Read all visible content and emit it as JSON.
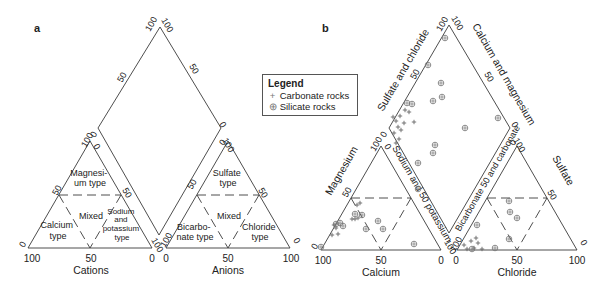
{
  "panels": {
    "a": {
      "label": "a",
      "cation_axis_title": "Cations",
      "anion_axis_title": "Anions",
      "cation_ticks": [
        "100",
        "50",
        "0"
      ],
      "anion_ticks": [
        "0",
        "50",
        "100"
      ],
      "regions": {
        "magnesium": [
          "Magnesi-",
          "um type"
        ],
        "mixed_cation": [
          "Mixed"
        ],
        "calcium": [
          "Calcium",
          "type"
        ],
        "sodium_potassium": [
          "Sodium",
          "and",
          "potassium",
          "type"
        ],
        "sulfate": [
          "Sulfate",
          "type"
        ],
        "mixed_anion": [
          "Mixed"
        ],
        "bicarbonate": [
          "Bicarbo-",
          "nate type"
        ],
        "chloride": [
          "Chloride",
          "type"
        ]
      }
    },
    "b": {
      "label": "b",
      "cation_axis_title": "Calcium",
      "anion_axis_title": "Chloride",
      "left_tri_side": "Magnesium",
      "right_tri_side": "Sulfate",
      "diamond_upper_left": "Sulfate and chloride",
      "diamond_upper_right": "Calcium and magnesium",
      "diamond_lower_left": "Sodium and 50 potassium",
      "diamond_lower_right": "Bicarbonate 50 and carbonate"
    }
  },
  "legend": {
    "title": "Legend",
    "items": [
      {
        "symbol": "+",
        "label": "Carbonate rocks"
      },
      {
        "symbol": "⊕",
        "label": "Silicate rocks"
      }
    ]
  },
  "chart_data": {
    "type": "scatter",
    "series": [
      {
        "name": "Carbonate rocks",
        "symbol": "+",
        "points_px": [
          [
            393,
            117
          ],
          [
            396,
            121
          ],
          [
            400,
            116
          ],
          [
            404,
            123
          ],
          [
            398,
            127
          ],
          [
            401,
            130
          ],
          [
            394,
            133
          ],
          [
            405,
            110
          ],
          [
            409,
            112
          ],
          [
            414,
            122
          ],
          [
            396,
            143
          ],
          [
            399,
            139
          ],
          [
            357,
            205
          ],
          [
            360,
            203
          ],
          [
            352,
            219
          ],
          [
            355,
            219
          ],
          [
            358,
            218
          ],
          [
            334,
            225
          ],
          [
            336,
            228
          ],
          [
            338,
            234
          ],
          [
            332,
            235
          ],
          [
            464,
            245
          ],
          [
            467,
            249
          ],
          [
            471,
            241
          ],
          [
            476,
            238
          ],
          [
            478,
            243
          ],
          [
            482,
            249
          ],
          [
            474,
            248
          ]
        ]
      },
      {
        "name": "Silicate rocks",
        "symbol": "⊕",
        "points_px": [
          [
            445,
            38
          ],
          [
            428,
            65
          ],
          [
            441,
            83
          ],
          [
            442,
            97
          ],
          [
            433,
            101
          ],
          [
            407,
            103
          ],
          [
            412,
            104
          ],
          [
            498,
            118
          ],
          [
            433,
            153
          ],
          [
            418,
            163
          ],
          [
            435,
            145
          ],
          [
            465,
            128
          ],
          [
            418,
            189
          ],
          [
            355,
            214
          ],
          [
            362,
            215
          ],
          [
            378,
            221
          ],
          [
            366,
            229
          ],
          [
            383,
            229
          ],
          [
            340,
            223
          ],
          [
            336,
            224
          ],
          [
            343,
            226
          ],
          [
            321,
            247
          ],
          [
            414,
            244
          ],
          [
            477,
            225
          ],
          [
            509,
            201
          ],
          [
            510,
            212
          ],
          [
            517,
            218
          ],
          [
            509,
            239
          ],
          [
            472,
            249
          ],
          [
            495,
            248
          ]
        ]
      }
    ]
  }
}
